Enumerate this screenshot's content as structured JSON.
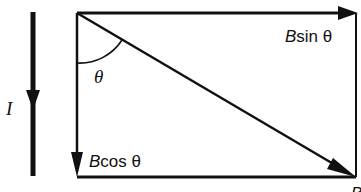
{
  "diagram": {
    "current_label": "I",
    "angle_label": "θ",
    "components": {
      "horizontal": {
        "symbol": "B",
        "func": "sin θ"
      },
      "vertical": {
        "symbol": "B",
        "func": "cos θ"
      }
    },
    "resultant_label_partial": "B",
    "colors": {
      "stroke": "#111111",
      "background": "#ffffff"
    }
  }
}
